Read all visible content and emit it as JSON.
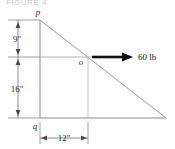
{
  "figure": {
    "caption": "FIGURE 4",
    "type": "statics-free-body-diagram"
  },
  "points": {
    "p": "p",
    "o": "o",
    "q": "q"
  },
  "dimensions": {
    "upper_vertical": "9\"",
    "lower_vertical": "16\"",
    "horizontal": "12\""
  },
  "force": {
    "label": "60 lb",
    "magnitude": 60,
    "unit": "lb",
    "direction": "right"
  },
  "colors": {
    "line": "#8a8a8a",
    "dimension_line": "#6f6f6f",
    "arrow": "#111111",
    "text": "#1a1a1a",
    "background": "#ffffff"
  }
}
